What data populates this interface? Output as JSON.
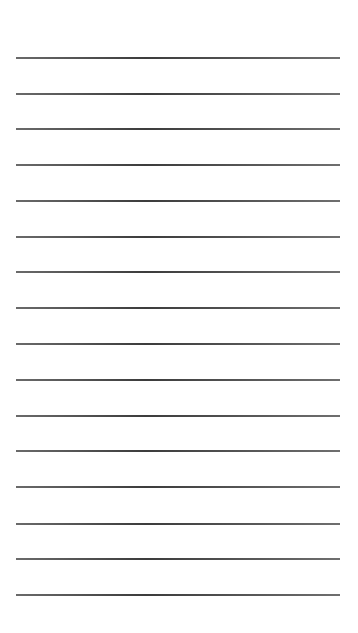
{
  "page": {
    "type": "lined-paper",
    "background_color": "#ffffff",
    "line_color": "#4a4a4a",
    "line_count": 16,
    "line_left": 16,
    "line_right": 340,
    "line_positions_y": [
      58,
      94,
      129,
      165,
      201,
      237,
      272,
      308,
      344,
      380,
      416,
      451,
      487,
      524,
      559,
      595
    ]
  }
}
